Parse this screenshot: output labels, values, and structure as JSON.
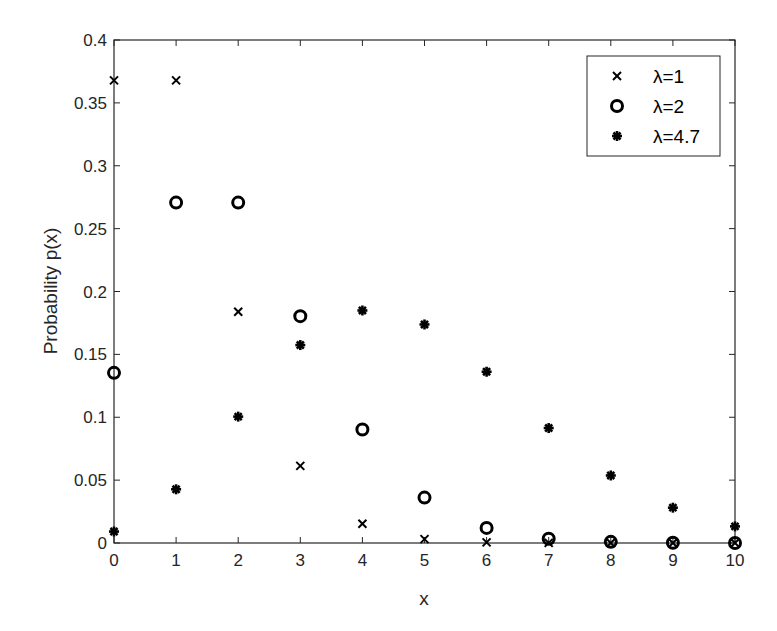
{
  "chart_data": {
    "type": "scatter",
    "title": "",
    "xlabel": "x",
    "ylabel": "Probability p(x)",
    "xlim": [
      0,
      10
    ],
    "ylim": [
      0,
      0.4
    ],
    "x_ticks": [
      "0",
      "1",
      "2",
      "3",
      "4",
      "5",
      "6",
      "7",
      "8",
      "9",
      "10"
    ],
    "y_ticks": [
      "0",
      "0.05",
      "0.1",
      "0.15",
      "0.2",
      "0.25",
      "0.3",
      "0.35",
      "0.4"
    ],
    "grid": false,
    "legend_position": "upper right",
    "x": [
      0,
      1,
      2,
      3,
      4,
      5,
      6,
      7,
      8,
      9,
      10
    ],
    "series": [
      {
        "name": "λ=1",
        "marker": "x",
        "values": [
          0.3679,
          0.3679,
          0.1839,
          0.0613,
          0.0153,
          0.0031,
          0.0005,
          0.0001,
          0.0,
          0.0,
          0.0
        ]
      },
      {
        "name": "λ=2",
        "marker": "o",
        "values": [
          0.1353,
          0.2707,
          0.2707,
          0.1804,
          0.0902,
          0.0361,
          0.012,
          0.0034,
          0.0009,
          0.0002,
          0.0
        ]
      },
      {
        "name": "λ=4.7",
        "marker": "*",
        "values": [
          0.0091,
          0.0427,
          0.1005,
          0.1574,
          0.1849,
          0.1738,
          0.1362,
          0.0914,
          0.0537,
          0.0281,
          0.0132
        ]
      }
    ]
  },
  "legend": [
    {
      "label": "λ=1",
      "symbol": "cross"
    },
    {
      "label": "λ=2",
      "symbol": "circle"
    },
    {
      "label": "λ=4.7",
      "symbol": "asterisk"
    }
  ]
}
